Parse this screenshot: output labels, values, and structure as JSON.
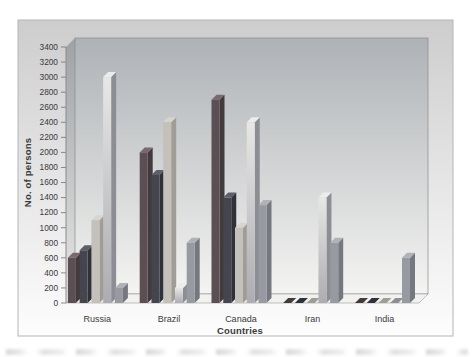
{
  "figure": {
    "background": "#ffffff",
    "panel": {
      "border_color": "#b5b5b5",
      "fill_top": "#cdcdcd",
      "fill_bottom": "#fdfdfd"
    },
    "wall": {
      "back_top": "#aeb2b6",
      "back_bottom": "#f4f4f2",
      "left_top": "#9ea2a6",
      "left_bottom": "#e8e8e6",
      "floor": "#f1f1ef",
      "edge_color": "#8a8a8a"
    },
    "text_color": "#3a3a3a"
  },
  "chart_data": {
    "type": "bar",
    "projection": "3d",
    "title": "",
    "xlabel": "Countries",
    "ylabel": "No. of persons",
    "categories": [
      "Russia",
      "Brazil",
      "Canada",
      "Iran",
      "India"
    ],
    "series": [
      {
        "name": "series-1",
        "values": [
          600,
          2000,
          2700,
          0,
          0
        ],
        "front": "#5c4f53",
        "side": "#423a3d",
        "top": "#79686d"
      },
      {
        "name": "series-2",
        "values": [
          700,
          1700,
          1400,
          0,
          0
        ],
        "front": "#44454e",
        "side": "#303139",
        "top": "#5d5e68"
      },
      {
        "name": "series-3",
        "values": [
          1100,
          2400,
          1000,
          0,
          0
        ],
        "front": "#c3c1ba",
        "side": "#9f9d96",
        "top": "#d6d4cd"
      },
      {
        "name": "series-4",
        "values": [
          3000,
          200,
          2400,
          1400,
          0
        ],
        "front": "gradient",
        "front_light": "#e7e7e5",
        "front_dark": "#acacb2",
        "side": "#8d8d94",
        "top": "#ececea"
      },
      {
        "name": "series-5",
        "values": [
          200,
          800,
          1300,
          800,
          600
        ],
        "front": "#989aa1",
        "side": "#76787f",
        "top": "#b0b2b8"
      }
    ],
    "ylim": [
      0,
      3400
    ],
    "ytick_step": 200,
    "yticks": [
      0,
      200,
      400,
      600,
      800,
      1000,
      1200,
      1400,
      1600,
      1800,
      2000,
      2200,
      2400,
      2600,
      2800,
      3000,
      3200,
      3400
    ],
    "legend": "none",
    "grid": false
  }
}
